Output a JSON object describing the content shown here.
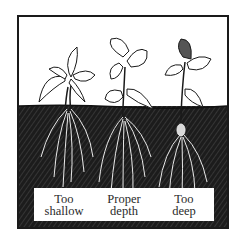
{
  "illustration": {
    "subject": "strawberry plants planted at different depths",
    "colors": {
      "soil": "#1c1c1c",
      "sky": "#ffffff",
      "ink": "#1a1a1a",
      "label_bg": "#ffffff"
    },
    "labels": [
      {
        "line1": "Too",
        "line2": "shallow"
      },
      {
        "line1": "Proper",
        "line2": "depth"
      },
      {
        "line1": "Too",
        "line2": "deep"
      }
    ]
  }
}
